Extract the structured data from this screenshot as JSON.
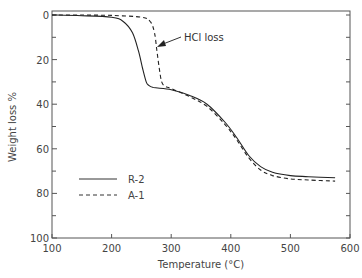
{
  "chart_data": {
    "type": "line",
    "title": "",
    "xlabel": "Temperature (°C)",
    "ylabel": "Weight loss %",
    "xlim": [
      100,
      600
    ],
    "ylim": [
      0,
      100
    ],
    "y_inverted": true,
    "x_ticks": [
      100,
      200,
      300,
      400,
      500,
      600
    ],
    "y_ticks": [
      0,
      20,
      40,
      60,
      80,
      100
    ],
    "grid": false,
    "legend_position": "lower-left inside",
    "series": [
      {
        "name": "R-2",
        "style": "solid",
        "x": [
          100,
          150,
          200,
          220,
          235,
          245,
          252,
          258,
          262,
          270,
          300,
          330,
          360,
          390,
          410,
          430,
          450,
          470,
          500,
          530,
          575
        ],
        "y": [
          0,
          0.3,
          1,
          3,
          8,
          16,
          24,
          30,
          31.5,
          32.5,
          33.5,
          36,
          40,
          48,
          55,
          63,
          68,
          70.5,
          72,
          72.5,
          73
        ]
      },
      {
        "name": "A-1",
        "style": "dashed",
        "x": [
          100,
          150,
          200,
          250,
          265,
          272,
          276,
          280,
          284,
          290,
          300,
          330,
          360,
          390,
          410,
          430,
          450,
          470,
          500,
          530,
          575
        ],
        "y": [
          0,
          0,
          0.2,
          1,
          3,
          8,
          16,
          24,
          30,
          32,
          33,
          36.5,
          41,
          49,
          56,
          64,
          69.5,
          72,
          73.5,
          74,
          74.5
        ]
      }
    ],
    "annotations": [
      {
        "text": "HCl loss",
        "arrow_to": {
          "x": 280,
          "y": 14
        }
      }
    ]
  },
  "labels": {
    "xlabel": "Temperature (°C)",
    "ylabel": "Weight loss %",
    "annotation": "HCl loss",
    "legend": [
      "R-2",
      "A-1"
    ],
    "x_ticks": [
      "100",
      "200",
      "300",
      "400",
      "500",
      "600"
    ],
    "y_ticks": [
      "0",
      "20",
      "40",
      "60",
      "80",
      "100"
    ]
  }
}
